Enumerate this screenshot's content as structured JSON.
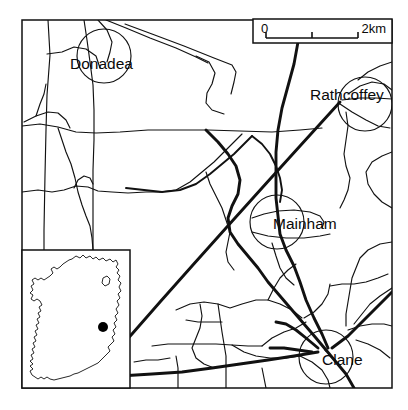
{
  "figure": {
    "kind": "locator-map",
    "region": "County Kildare, Ireland",
    "background_color": "#ffffff",
    "line_color": "#111111"
  },
  "main_map": {
    "frame": {
      "x": 22,
      "y": 20,
      "width": 370,
      "height": 368
    },
    "places": [
      {
        "id": "donadea",
        "label": "Donadea",
        "label_x": 70,
        "label_y": 69,
        "circle_cx": 104,
        "circle_cy": 56,
        "circle_r": 27
      },
      {
        "id": "rathcoffey",
        "label": "Rathcoffey",
        "label_x": 310,
        "label_y": 100,
        "circle_cx": 365,
        "circle_cy": 104,
        "circle_r": 27
      },
      {
        "id": "mainham",
        "label": "Mainham",
        "label_x": 273,
        "label_y": 229,
        "circle_cx": 277,
        "circle_cy": 222,
        "circle_r": 27
      },
      {
        "id": "clane",
        "label": "Clane",
        "label_x": 322,
        "label_y": 365,
        "circle_cx": 326,
        "circle_cy": 357,
        "circle_r": 27
      }
    ]
  },
  "scale_bar": {
    "box": {
      "x": 253,
      "y": 19,
      "width": 139,
      "height": 24
    },
    "min_label": "0",
    "max_label": "2km",
    "units": "km",
    "max_value": 2,
    "ticks": [
      0,
      1,
      2
    ]
  },
  "inset_map": {
    "box": {
      "x": 22,
      "y": 250,
      "width": 108,
      "height": 138
    },
    "subject": "Ireland",
    "marker": {
      "cx": 103,
      "cy": 327,
      "r": 5,
      "color": "#000000",
      "meaning": "study-area-location"
    }
  }
}
